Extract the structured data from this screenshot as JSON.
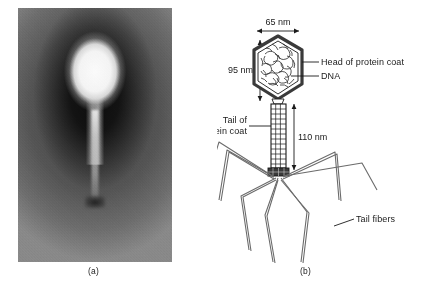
{
  "figure": {
    "panels": [
      {
        "id": "a",
        "caption": "(a)",
        "type": "electron-micrograph",
        "subject": "bacteriophage"
      },
      {
        "id": "b",
        "caption": "(b)",
        "type": "labeled-diagram",
        "subject": "bacteriophage structure"
      }
    ]
  },
  "diagram": {
    "dimensions": {
      "head_width": "65 nm",
      "head_height": "95 nm",
      "tail_length": "110 nm"
    },
    "labels": {
      "head": "Head of protein coat",
      "dna": "DNA",
      "tail": "Tail of\nprotein coat",
      "tail_line1": "Tail of",
      "tail_line2": "protein coat",
      "fibers": "Tail fibers"
    },
    "colors": {
      "line": "#1a1a1a",
      "capsid_shell": "#555555",
      "fill": "#ffffff"
    },
    "counts": {
      "tail_fibers": 6
    }
  }
}
